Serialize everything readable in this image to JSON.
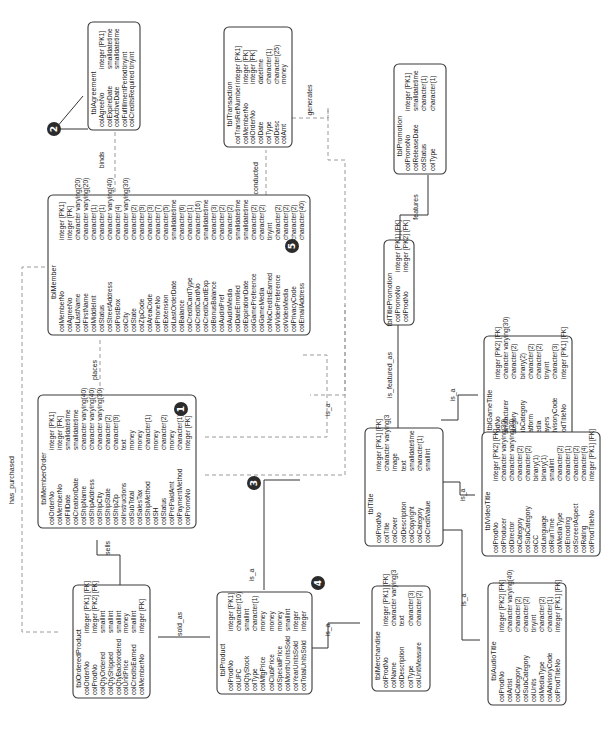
{
  "diagram": {
    "type": "entity-relationship",
    "orientation": "rotated-90-ccw",
    "entities": [
      {
        "id": "tblAgreement",
        "title": "tblAgreement",
        "columns": [
          {
            "name": "colAgreeNo",
            "type": "integer  [PK1]"
          },
          {
            "name": "colExpireDate",
            "type": "smalldatetime"
          },
          {
            "name": "colActiveDate",
            "type": "smalldatetime"
          },
          {
            "name": "colFulfillmentPeriod",
            "type": "tinyint"
          },
          {
            "name": "colCreditsRequired",
            "type": "tinyint"
          }
        ]
      },
      {
        "id": "tblTransaction",
        "title": "tblTransaction",
        "columns": [
          {
            "name": "colTransRefNumber",
            "type": "integer  [PK1]"
          },
          {
            "name": "colMemberNo",
            "type": "integer  [FK]"
          },
          {
            "name": "colOrderNo",
            "type": "integer  [FK]"
          },
          {
            "name": "colDate",
            "type": "datetime"
          },
          {
            "name": "colType",
            "type": "character(1)"
          },
          {
            "name": "colDesc",
            "type": "character(25)"
          },
          {
            "name": "colAmt",
            "type": "money"
          }
        ]
      },
      {
        "id": "tblPromotion",
        "title": "tblPromotion",
        "columns": [
          {
            "name": "colPromoNo",
            "type": "integer  [PK1]"
          },
          {
            "name": "colReleaseDate",
            "type": "smalldatetime"
          },
          {
            "name": "colStatus",
            "type": "character(1)"
          },
          {
            "name": "colType",
            "type": "character(1)"
          }
        ]
      },
      {
        "id": "tblMember",
        "title": "tblMember",
        "badge": "5",
        "columns": [
          {
            "name": "colMemberNo",
            "type": "integer  [PK1]"
          },
          {
            "name": "colAgreeNo",
            "type": "integer  [FK]"
          },
          {
            "name": "colLastName",
            "type": "character varying(20)"
          },
          {
            "name": "colFirstName",
            "type": "character varying(20)"
          },
          {
            "name": "colMiddleInit",
            "type": "character(1)"
          },
          {
            "name": "colStatus",
            "type": "character(1)"
          },
          {
            "name": "colStreetAddress",
            "type": "character varying(40)"
          },
          {
            "name": "colPostBox",
            "type": "character(4)"
          },
          {
            "name": "colCity",
            "type": "character varying(30)"
          },
          {
            "name": "colState",
            "type": "character(2)"
          },
          {
            "name": "colZipCode",
            "type": "character(9)"
          },
          {
            "name": "colAreaCode",
            "type": "character(3)"
          },
          {
            "name": "colPhoneNo",
            "type": "character(7)"
          },
          {
            "name": "colExtension",
            "type": "character(5)"
          },
          {
            "name": "colLastOrderDate",
            "type": "smalldatetime"
          },
          {
            "name": "colBalance",
            "type": "character(6)"
          },
          {
            "name": "colCreditCardType",
            "type": "character(1)"
          },
          {
            "name": "colCreditCardNo",
            "type": "character(16)"
          },
          {
            "name": "colCreditCardExp",
            "type": "smalldatetime"
          },
          {
            "name": "colBonusBalance",
            "type": "character(3)"
          },
          {
            "name": "colAudioPref",
            "type": "character(2)"
          },
          {
            "name": "colAudioMedia",
            "type": "character(2)"
          },
          {
            "name": "colDateEnrolled",
            "type": "smalldatetime"
          },
          {
            "name": "colExpirationDate",
            "type": "smalldatetime"
          },
          {
            "name": "colGamePreference",
            "type": "character(2)"
          },
          {
            "name": "colGameMedia",
            "type": "character(2)"
          },
          {
            "name": "colNoCreditsEarned",
            "type": "tinyint"
          },
          {
            "name": "colVideoPreference",
            "type": "character(2)"
          },
          {
            "name": "colVideoMedia",
            "type": "character(2)"
          },
          {
            "name": "colPrivacyCode",
            "type": "character(2)"
          },
          {
            "name": "colEmailAddress",
            "type": "character(40)"
          }
        ]
      },
      {
        "id": "tblTitlePromotion",
        "title": "tblTitlePromotion",
        "columns": [
          {
            "name": "colPromoNo",
            "type": "integer  [PK1]  [FK]"
          },
          {
            "name": "colProdNo",
            "type": "integer  [PK2]  [FK]"
          }
        ]
      },
      {
        "id": "tblMemberOrder",
        "title": "tblMemberOrder",
        "badge": "1",
        "columns": [
          {
            "name": "colOrderNo",
            "type": "integer  [PK1]"
          },
          {
            "name": "colMemberNo",
            "type": "integer  [FK]"
          },
          {
            "name": "colFillDate",
            "type": "smalldatetime"
          },
          {
            "name": "colCreationDate",
            "type": "smalldatetime"
          },
          {
            "name": "colShipName",
            "type": "character varying(40)"
          },
          {
            "name": "colShipAddress",
            "type": "character varying(40)"
          },
          {
            "name": "colShipCity",
            "type": "character varying(30)"
          },
          {
            "name": "colShipState",
            "type": "character(2)"
          },
          {
            "name": "colShipZip",
            "type": "character(9)"
          },
          {
            "name": "colInstructions",
            "type": "text"
          },
          {
            "name": "colSubTotal",
            "type": "money"
          },
          {
            "name": "colSalesTax",
            "type": "money"
          },
          {
            "name": "colShipMethod",
            "type": "character(1)"
          },
          {
            "name": "colSH",
            "type": "money"
          },
          {
            "name": "colStatus",
            "type": "character(2)"
          },
          {
            "name": "colPrePaidAmt",
            "type": "money"
          },
          {
            "name": "colPaymentMethod",
            "type": "character(1)"
          },
          {
            "name": "colPromoNo",
            "type": "integer  [FK]"
          }
        ]
      },
      {
        "id": "tblTitle",
        "title": "tblTitle",
        "badge": "3",
        "columns": [
          {
            "name": "colProdNo",
            "type": "integer  [PK1]  [FK]"
          },
          {
            "name": "colTitle",
            "type": "character varying(3"
          },
          {
            "name": "colCover",
            "type": "image"
          },
          {
            "name": "colDescription",
            "type": "text"
          },
          {
            "name": "colCopyright",
            "type": "smalldatetime"
          },
          {
            "name": "colCategory",
            "type": "character(1)"
          },
          {
            "name": "colCreditValue",
            "type": "smallint"
          }
        ]
      },
      {
        "id": "tblGameTitle",
        "title": "tblGameTitle",
        "columns": [
          {
            "name": "colProdNo",
            "type": "integer  [PK2]  [FK]"
          },
          {
            "name": "colManufacturer",
            "type": "character varying(30)"
          },
          {
            "name": "colCategory",
            "type": "character(2)"
          },
          {
            "name": "colSubCategory",
            "type": "binary(2)"
          },
          {
            "name": "colPlatform",
            "type": "character(2)"
          },
          {
            "name": "colMedia",
            "type": "character(2)"
          },
          {
            "name": "colPlayers",
            "type": "tinyint"
          },
          {
            "name": "colAdvisoryCode",
            "type": "character(3)"
          },
          {
            "name": "colProdTitleNo",
            "type": "integer  [PK1]  [FK]"
          }
        ]
      },
      {
        "id": "tblOrderedProduct",
        "title": "tblOrderedProduct",
        "columns": [
          {
            "name": "colOrderNo",
            "type": "integer  [PK1]  [FK]"
          },
          {
            "name": "colProdNo",
            "type": "integer  [PK2]  [FK]"
          },
          {
            "name": "colQtyOrdered",
            "type": "smallint"
          },
          {
            "name": "colQtyShipped",
            "type": "smallint"
          },
          {
            "name": "colQtyBackordered",
            "type": "smallint"
          },
          {
            "name": "colUnitPrice",
            "type": "money"
          },
          {
            "name": "colCreditsEarned",
            "type": "smallint"
          },
          {
            "name": "colMemberNo",
            "type": "integer  [FK]"
          }
        ]
      },
      {
        "id": "tblProduct",
        "title": "tblProduct",
        "badge": "4",
        "columns": [
          {
            "name": "colProdNo",
            "type": "integer  [PK1]"
          },
          {
            "name": "colUPC",
            "type": "character(10)"
          },
          {
            "name": "colQtyStock",
            "type": "smallint"
          },
          {
            "name": "colType",
            "type": "character(1)"
          },
          {
            "name": "colMfgPrice",
            "type": "money"
          },
          {
            "name": "colClubPrice",
            "type": "money"
          },
          {
            "name": "colSpecialPrice",
            "type": "money"
          },
          {
            "name": "colMonthUnitsSold",
            "type": "smallint"
          },
          {
            "name": "colYearUnitsSold",
            "type": "integer"
          },
          {
            "name": "colTotalUnitsSold",
            "type": "integer"
          }
        ]
      },
      {
        "id": "tblMerchandise",
        "title": "tblMerchandise",
        "columns": [
          {
            "name": "colProdNo",
            "type": "integer  [PK1]  [FK]"
          },
          {
            "name": "colName",
            "type": "character varying(3"
          },
          {
            "name": "colDescription",
            "type": "text"
          },
          {
            "name": "colType",
            "type": "character(3)"
          },
          {
            "name": "colUnitMeasure",
            "type": "character(2)"
          }
        ]
      },
      {
        "id": "tblVideoTitle",
        "title": "tblVideoTitle",
        "columns": [
          {
            "name": "colProdNo",
            "type": "integer  [PK2]  [FK]"
          },
          {
            "name": "colProducer",
            "type": "character varying(30)"
          },
          {
            "name": "colDirector",
            "type": "character varying(30)"
          },
          {
            "name": "colCategory",
            "type": "character(2)"
          },
          {
            "name": "colSubCategory",
            "type": "character(2)"
          },
          {
            "name": "colCC",
            "type": "binary(1)"
          },
          {
            "name": "colLanguage",
            "type": "binary(1)"
          },
          {
            "name": "colRunTime",
            "type": "smallint"
          },
          {
            "name": "colMediaType",
            "type": "character(2)"
          },
          {
            "name": "colEncoding",
            "type": "character(1)"
          },
          {
            "name": "colScreenAspect",
            "type": "character(2)"
          },
          {
            "name": "colRating",
            "type": "character(4)"
          },
          {
            "name": "colProdTitleNo",
            "type": "integer  [PK1]  [FK]"
          }
        ]
      },
      {
        "id": "tblAudioTitle",
        "title": "tblAudioTitle",
        "columns": [
          {
            "name": "colProdNo",
            "type": "integer  [PK2]  [FK]"
          },
          {
            "name": "colArtist",
            "type": "character varying(40)"
          },
          {
            "name": "colCategory",
            "type": "character(2)"
          },
          {
            "name": "colSubCategory",
            "type": "character(2)"
          },
          {
            "name": "colUnits",
            "type": "tinyint"
          },
          {
            "name": "colMediaType",
            "type": "character(2)"
          },
          {
            "name": "colAdvisoryCode",
            "type": "character(1)"
          },
          {
            "name": "colProdTitleNo",
            "type": "integer  [PK1]  [FK]"
          }
        ]
      }
    ],
    "relationships": [
      {
        "label": "binds",
        "from": "tblAgreement",
        "to": "tblMember",
        "style": "dashed"
      },
      {
        "label": "has conducted",
        "from": "tblMember",
        "to": "tblTransaction",
        "style": "dashed"
      },
      {
        "label": "generates",
        "from": "tblPromotion",
        "to": "tblTransaction",
        "style": "dashed"
      },
      {
        "label": "features",
        "from": "tblPromotion",
        "to": "tblTitlePromotion",
        "style": "solid"
      },
      {
        "label": "places",
        "from": "tblMember",
        "to": "tblMemberOrder",
        "style": "dashed"
      },
      {
        "label": "is_a",
        "from": "tblMember",
        "to": "tblTitle",
        "style": "dashed"
      },
      {
        "label": "is_featured_as",
        "from": "tblTitle",
        "to": "tblTitlePromotion",
        "style": "solid"
      },
      {
        "label": "has_purchased",
        "from": "tblMember",
        "to": "tblOrderedProduct",
        "style": "dashed"
      },
      {
        "label": "sells",
        "from": "tblMemberOrder",
        "to": "tblOrderedProduct",
        "style": "solid"
      },
      {
        "label": "sold_as",
        "from": "tblProduct",
        "to": "tblOrderedProduct",
        "style": "solid"
      },
      {
        "label": "is_a",
        "from": "tblProduct",
        "to": "tblTitle",
        "style": "solid"
      },
      {
        "label": "is_a",
        "from": "tblProduct",
        "to": "tblMerchandise",
        "style": "solid"
      },
      {
        "label": "is_a",
        "from": "tblTitle",
        "to": "tblGameTitle",
        "style": "solid"
      },
      {
        "label": "is_a",
        "from": "tblTitle",
        "to": "tblVideoTitle",
        "style": "solid"
      },
      {
        "label": "is_a",
        "from": "tblTitle",
        "to": "tblAudioTitle",
        "style": "solid"
      }
    ],
    "annotations": [
      {
        "badge": "2",
        "points_to": "tblAgreement"
      }
    ]
  }
}
